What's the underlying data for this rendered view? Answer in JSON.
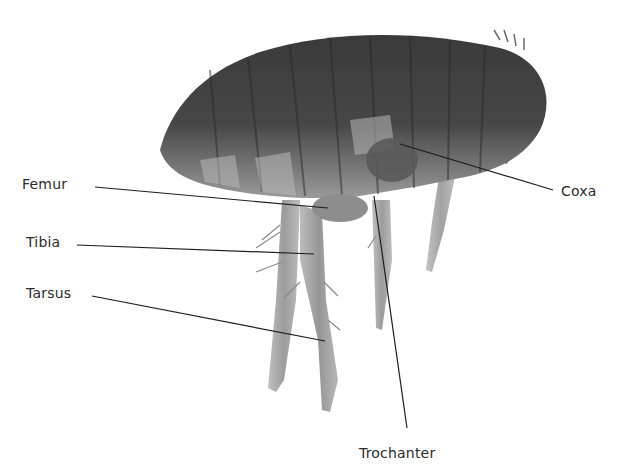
{
  "figure": {
    "labels": [
      {
        "id": "femur",
        "text": "Femur",
        "x": 22,
        "y": 176,
        "line": [
          95,
          187,
          328,
          208
        ]
      },
      {
        "id": "tibia",
        "text": "Tibia",
        "x": 26,
        "y": 234,
        "line": [
          77,
          245,
          314,
          254
        ]
      },
      {
        "id": "tarsus",
        "text": "Tarsus",
        "x": 26,
        "y": 285,
        "line": [
          92,
          296,
          325,
          341
        ]
      },
      {
        "id": "coxa",
        "text": "Coxa",
        "x": 561,
        "y": 183,
        "line": [
          400,
          144,
          553,
          190
        ]
      },
      {
        "id": "trochanter",
        "text": "Trochanter",
        "x": 359,
        "y": 445,
        "line": [
          374,
          196,
          407,
          428
        ]
      }
    ],
    "colors": {
      "line": "#1e1e1e",
      "text": "#2b2b2b",
      "body_dark": "#3a3a3a",
      "body_mid": "#6e6e6e",
      "body_light": "#a8a8a8",
      "leg": "#9a9a9a"
    }
  }
}
